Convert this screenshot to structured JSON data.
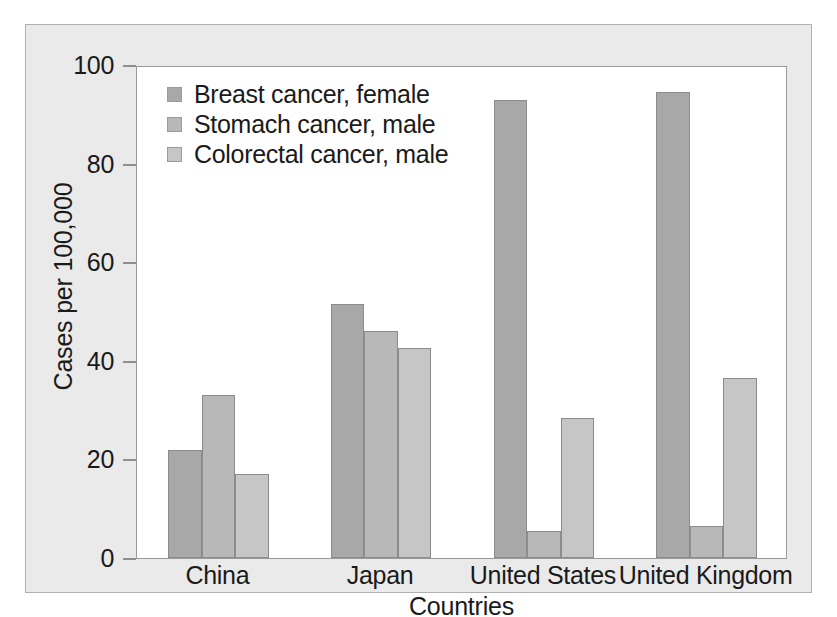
{
  "chart_data": {
    "type": "bar",
    "title": "",
    "subtitle": "",
    "xlabel": "Countries",
    "ylabel": "Cases per 100,000",
    "categories": [
      "China",
      "Japan",
      "United States",
      "United Kingdom"
    ],
    "series": [
      {
        "name": "Breast cancer, female",
        "color": "#a8a8a8",
        "values": [
          22.0,
          51.5,
          93.0,
          94.5
        ]
      },
      {
        "name": "Stomach cancer, male",
        "color": "#b8b8b8",
        "values": [
          33.0,
          46.0,
          5.5,
          6.5
        ]
      },
      {
        "name": "Colorectal cancer, male",
        "color": "#c6c6c6",
        "values": [
          17.0,
          42.5,
          28.5,
          36.5
        ]
      }
    ],
    "ylim": [
      0,
      100
    ],
    "yticks": [
      0,
      20,
      40,
      60,
      80,
      100
    ],
    "ytick_labels": [
      "0",
      "20",
      "40",
      "60",
      "80",
      "100"
    ],
    "grid": false,
    "legend_position": "top-left",
    "orientation": "vertical",
    "grouping": "grouped"
  },
  "figure": {
    "background_color": "#eaeaea",
    "plot_background_color": "#ffffff",
    "border_color": "#b0b0b0",
    "axis_color": "#9a9a9a",
    "bar_border_color": "#8c8c8c",
    "text_color": "#1a1a1a"
  }
}
